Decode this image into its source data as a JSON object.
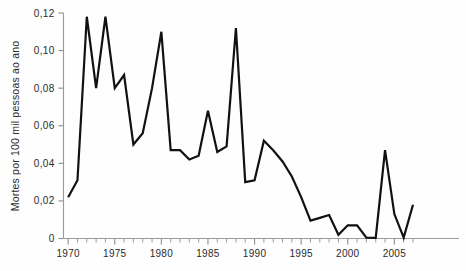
{
  "chart_data": {
    "type": "line",
    "title": "",
    "subtitle": "",
    "xlabel": "",
    "ylabel": "Mortes por 100 mil pessoas ao ano",
    "xlim": [
      1969.5,
      2007.2
    ],
    "ylim": [
      0,
      0.12
    ],
    "grid": false,
    "legend": null,
    "decimal_separator": ",",
    "y_ticks": [
      0,
      0.02,
      0.04,
      0.06,
      0.08,
      0.1,
      0.12
    ],
    "y_tick_labels": [
      "0",
      "0,02",
      "0,04",
      "0,06",
      "0,08",
      "0,10",
      "0,12"
    ],
    "x_ticks": [
      1970,
      1975,
      1980,
      1985,
      1990,
      1995,
      2000,
      2005
    ],
    "x_tick_labels": [
      "1970",
      "1975",
      "1980",
      "1985",
      "1990",
      "1995",
      "2000",
      "2005"
    ],
    "x_minor_tick_interval": 1,
    "line_color": "#111111",
    "axis_color": "#8d8d8d",
    "background_color": "#fefefe",
    "x": [
      1970,
      1971,
      1972,
      1973,
      1974,
      1975,
      1976,
      1977,
      1978,
      1979,
      1980,
      1981,
      1982,
      1983,
      1984,
      1985,
      1986,
      1987,
      1988,
      1989,
      1990,
      1991,
      1992,
      1993,
      1994,
      1995,
      1996,
      1997,
      1998,
      1999,
      2000,
      2001,
      2002,
      2003,
      2004,
      2005,
      2006,
      2007
    ],
    "values": [
      0.022,
      0.031,
      0.118,
      0.08,
      0.118,
      0.08,
      0.087,
      0.05,
      0.056,
      0.08,
      0.11,
      0.047,
      0.047,
      0.042,
      0.044,
      0.068,
      0.046,
      0.049,
      0.112,
      0.03,
      0.031,
      0.052,
      0.047,
      0.041,
      0.033,
      0.022,
      0.0095,
      0.011,
      0.0125,
      0.002,
      0.007,
      0.007,
      0.0005,
      0.0003,
      0.047,
      0.013,
      0.0005,
      0.018
    ],
    "series": [
      {
        "name": "Mortes por 100 mil pessoas ao ano",
        "values": [
          0.022,
          0.031,
          0.118,
          0.08,
          0.118,
          0.08,
          0.087,
          0.05,
          0.056,
          0.08,
          0.11,
          0.047,
          0.047,
          0.042,
          0.044,
          0.068,
          0.046,
          0.049,
          0.112,
          0.03,
          0.031,
          0.052,
          0.047,
          0.041,
          0.033,
          0.022,
          0.0095,
          0.011,
          0.0125,
          0.002,
          0.007,
          0.007,
          0.0005,
          0.0003,
          0.047,
          0.013,
          0.0005,
          0.018
        ]
      }
    ],
    "annotations": []
  }
}
